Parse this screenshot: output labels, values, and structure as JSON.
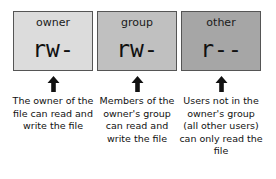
{
  "diagram": {
    "background_color": "#ffffff",
    "columns": [
      {
        "id": "owner",
        "label": "owner",
        "permission_bits": "rw-",
        "box_fill": "#dcdcdc",
        "box_border": "#555555",
        "arrow_icon": "arrow-up-icon",
        "description": "The owner of the file can read and write the file"
      },
      {
        "id": "group",
        "label": "group",
        "permission_bits": "rw-",
        "box_fill": "#c0c0c0",
        "box_border": "#555555",
        "arrow_icon": "arrow-up-icon",
        "description": "Members of the owner's group can read and write the file"
      },
      {
        "id": "other",
        "label": "other",
        "permission_bits": "r--",
        "box_fill": "#a6a6a6",
        "box_border": "#555555",
        "arrow_icon": "arrow-up-icon",
        "description": "Users not in the owner's group (all other users) can only read the file"
      }
    ]
  }
}
